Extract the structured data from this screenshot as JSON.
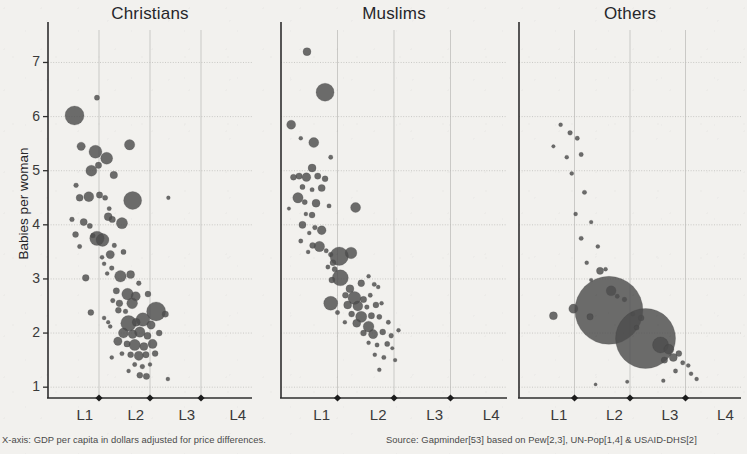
{
  "figure": {
    "y_axis_title": "Babies per woman",
    "footnote_left": "X-axis: GDP per capita in dollars adjusted for price differences.",
    "footnote_right": "Source: Gapminder[53] based on Pew[2,3], UN-Pop[1,4] & USAID-DHS[2]",
    "bubble_color": "#4d4d4d",
    "grid_color": "#b9b8b4",
    "axis_color": "#2e2e2e",
    "background_color": "#f2f1ee"
  },
  "chart_data": {
    "type": "scatter",
    "xlabel": "X-axis: GDP per capita in dollars adjusted for price differences.",
    "ylabel": "Babies per woman",
    "ylim": [
      0.8,
      7.6
    ],
    "yticks": [
      1,
      2,
      3,
      4,
      5,
      6,
      7
    ],
    "xticks": [
      "L1",
      "L2",
      "L3",
      "L4"
    ],
    "xlim": [
      0,
      4
    ],
    "grid": true,
    "legend": "none",
    "size_encoding": "population",
    "panels": [
      {
        "name": "Christians",
        "points": [
          {
            "x": 0.52,
            "y": 6.02,
            "r": 9.5
          },
          {
            "x": 0.96,
            "y": 6.35,
            "r": 2.6
          },
          {
            "x": 0.65,
            "y": 5.45,
            "r": 4.2
          },
          {
            "x": 0.93,
            "y": 5.35,
            "r": 6.5
          },
          {
            "x": 0.99,
            "y": 5.1,
            "r": 3.2
          },
          {
            "x": 1.15,
            "y": 5.23,
            "r": 6.0
          },
          {
            "x": 1.6,
            "y": 5.48,
            "r": 5.2
          },
          {
            "x": 0.85,
            "y": 5.0,
            "r": 5.5
          },
          {
            "x": 1.29,
            "y": 4.92,
            "r": 3.8
          },
          {
            "x": 0.55,
            "y": 4.73,
            "r": 2.4
          },
          {
            "x": 0.62,
            "y": 4.5,
            "r": 3.5
          },
          {
            "x": 0.8,
            "y": 4.52,
            "r": 5.0
          },
          {
            "x": 1.01,
            "y": 4.55,
            "r": 3.2
          },
          {
            "x": 1.12,
            "y": 4.5,
            "r": 2.6
          },
          {
            "x": 1.66,
            "y": 4.45,
            "r": 9.0
          },
          {
            "x": 2.36,
            "y": 4.5,
            "r": 1.9
          },
          {
            "x": 1.2,
            "y": 4.3,
            "r": 2.2
          },
          {
            "x": 1.18,
            "y": 4.15,
            "r": 4.0
          },
          {
            "x": 1.26,
            "y": 4.1,
            "r": 3.2
          },
          {
            "x": 0.47,
            "y": 4.1,
            "r": 2.4
          },
          {
            "x": 0.7,
            "y": 4.05,
            "r": 3.6
          },
          {
            "x": 0.82,
            "y": 3.98,
            "r": 2.6
          },
          {
            "x": 1.45,
            "y": 4.03,
            "r": 5.6
          },
          {
            "x": 0.54,
            "y": 3.82,
            "r": 3.0
          },
          {
            "x": 0.88,
            "y": 3.8,
            "r": 2.4
          },
          {
            "x": 0.96,
            "y": 3.75,
            "r": 7.2
          },
          {
            "x": 1.07,
            "y": 3.72,
            "r": 6.4
          },
          {
            "x": 0.62,
            "y": 3.6,
            "r": 2.2
          },
          {
            "x": 1.3,
            "y": 3.62,
            "r": 2.3
          },
          {
            "x": 1.22,
            "y": 3.45,
            "r": 4.2
          },
          {
            "x": 1.06,
            "y": 3.4,
            "r": 2.1
          },
          {
            "x": 1.48,
            "y": 3.5,
            "r": 2.6
          },
          {
            "x": 1.1,
            "y": 3.28,
            "r": 2.0
          },
          {
            "x": 1.25,
            "y": 3.2,
            "r": 2.4
          },
          {
            "x": 1.16,
            "y": 3.1,
            "r": 2.0
          },
          {
            "x": 1.42,
            "y": 3.05,
            "r": 5.8
          },
          {
            "x": 1.62,
            "y": 3.08,
            "r": 4.0
          },
          {
            "x": 0.74,
            "y": 3.02,
            "r": 3.4
          },
          {
            "x": 1.78,
            "y": 2.92,
            "r": 2.4
          },
          {
            "x": 1.34,
            "y": 2.78,
            "r": 3.2
          },
          {
            "x": 1.56,
            "y": 2.72,
            "r": 5.8
          },
          {
            "x": 1.72,
            "y": 2.68,
            "r": 4.6
          },
          {
            "x": 1.96,
            "y": 2.72,
            "r": 3.0
          },
          {
            "x": 1.27,
            "y": 2.6,
            "r": 2.3
          },
          {
            "x": 1.4,
            "y": 2.55,
            "r": 3.4
          },
          {
            "x": 1.65,
            "y": 2.55,
            "r": 5.4
          },
          {
            "x": 1.38,
            "y": 2.42,
            "r": 3.0
          },
          {
            "x": 1.52,
            "y": 2.4,
            "r": 2.4
          },
          {
            "x": 0.84,
            "y": 2.38,
            "r": 3.0
          },
          {
            "x": 2.12,
            "y": 2.4,
            "r": 9.5
          },
          {
            "x": 2.3,
            "y": 2.35,
            "r": 3.2
          },
          {
            "x": 1.1,
            "y": 2.28,
            "r": 2.0
          },
          {
            "x": 1.18,
            "y": 2.2,
            "r": 1.9
          },
          {
            "x": 1.22,
            "y": 2.12,
            "r": 2.0
          },
          {
            "x": 1.58,
            "y": 2.18,
            "r": 7.8
          },
          {
            "x": 1.73,
            "y": 2.2,
            "r": 4.0
          },
          {
            "x": 1.86,
            "y": 2.25,
            "r": 6.8
          },
          {
            "x": 2.02,
            "y": 2.15,
            "r": 4.2
          },
          {
            "x": 1.48,
            "y": 2.0,
            "r": 5.0
          },
          {
            "x": 1.66,
            "y": 1.98,
            "r": 4.4
          },
          {
            "x": 1.8,
            "y": 2.02,
            "r": 5.2
          },
          {
            "x": 1.95,
            "y": 1.95,
            "r": 3.6
          },
          {
            "x": 2.18,
            "y": 2.0,
            "r": 3.0
          },
          {
            "x": 1.37,
            "y": 1.85,
            "r": 4.2
          },
          {
            "x": 1.55,
            "y": 1.8,
            "r": 3.2
          },
          {
            "x": 1.7,
            "y": 1.78,
            "r": 5.6
          },
          {
            "x": 1.88,
            "y": 1.75,
            "r": 4.0
          },
          {
            "x": 2.05,
            "y": 1.8,
            "r": 4.6
          },
          {
            "x": 1.45,
            "y": 1.62,
            "r": 2.2
          },
          {
            "x": 1.62,
            "y": 1.6,
            "r": 3.0
          },
          {
            "x": 1.78,
            "y": 1.58,
            "r": 4.6
          },
          {
            "x": 1.92,
            "y": 1.6,
            "r": 3.2
          },
          {
            "x": 2.1,
            "y": 1.62,
            "r": 3.0
          },
          {
            "x": 1.25,
            "y": 1.55,
            "r": 2.0
          },
          {
            "x": 1.7,
            "y": 1.42,
            "r": 2.2
          },
          {
            "x": 1.85,
            "y": 1.38,
            "r": 2.4
          },
          {
            "x": 2.0,
            "y": 1.42,
            "r": 2.0
          },
          {
            "x": 1.58,
            "y": 1.3,
            "r": 2.0
          },
          {
            "x": 1.8,
            "y": 1.22,
            "r": 3.0
          },
          {
            "x": 1.93,
            "y": 1.2,
            "r": 3.2
          },
          {
            "x": 2.35,
            "y": 1.15,
            "r": 2.0
          }
        ]
      },
      {
        "name": "Muslims",
        "points": [
          {
            "x": 0.46,
            "y": 7.2,
            "r": 4.0
          },
          {
            "x": 0.78,
            "y": 6.45,
            "r": 9.0
          },
          {
            "x": 0.18,
            "y": 5.85,
            "r": 4.5
          },
          {
            "x": 0.58,
            "y": 5.52,
            "r": 5.0
          },
          {
            "x": 0.35,
            "y": 5.6,
            "r": 2.0
          },
          {
            "x": 0.88,
            "y": 5.25,
            "r": 2.2
          },
          {
            "x": 0.55,
            "y": 5.05,
            "r": 4.0
          },
          {
            "x": 0.32,
            "y": 4.9,
            "r": 3.2
          },
          {
            "x": 0.45,
            "y": 4.88,
            "r": 4.4
          },
          {
            "x": 0.65,
            "y": 4.9,
            "r": 3.2
          },
          {
            "x": 0.22,
            "y": 4.88,
            "r": 3.0
          },
          {
            "x": 0.78,
            "y": 4.85,
            "r": 3.0
          },
          {
            "x": 0.38,
            "y": 4.7,
            "r": 2.6
          },
          {
            "x": 0.55,
            "y": 4.65,
            "r": 2.2
          },
          {
            "x": 0.72,
            "y": 4.68,
            "r": 3.6
          },
          {
            "x": 0.3,
            "y": 4.5,
            "r": 5.2
          },
          {
            "x": 0.42,
            "y": 4.42,
            "r": 2.6
          },
          {
            "x": 0.62,
            "y": 4.4,
            "r": 4.0
          },
          {
            "x": 0.85,
            "y": 4.35,
            "r": 2.2
          },
          {
            "x": 0.14,
            "y": 4.3,
            "r": 1.8
          },
          {
            "x": 0.44,
            "y": 4.2,
            "r": 2.0
          },
          {
            "x": 0.55,
            "y": 4.18,
            "r": 3.0
          },
          {
            "x": 1.32,
            "y": 4.32,
            "r": 5.0
          },
          {
            "x": 0.38,
            "y": 4.0,
            "r": 3.6
          },
          {
            "x": 0.6,
            "y": 3.95,
            "r": 2.4
          },
          {
            "x": 0.5,
            "y": 3.85,
            "r": 2.0
          },
          {
            "x": 0.72,
            "y": 3.9,
            "r": 4.4
          },
          {
            "x": 0.35,
            "y": 3.7,
            "r": 2.2
          },
          {
            "x": 0.56,
            "y": 3.62,
            "r": 3.0
          },
          {
            "x": 0.68,
            "y": 3.6,
            "r": 5.2
          },
          {
            "x": 0.48,
            "y": 3.5,
            "r": 2.0
          },
          {
            "x": 0.8,
            "y": 3.52,
            "r": 2.2
          },
          {
            "x": 0.88,
            "y": 3.45,
            "r": 2.4
          },
          {
            "x": 1.03,
            "y": 3.42,
            "r": 9.2
          },
          {
            "x": 1.24,
            "y": 3.48,
            "r": 5.8
          },
          {
            "x": 0.92,
            "y": 3.3,
            "r": 3.0
          },
          {
            "x": 0.83,
            "y": 3.22,
            "r": 2.2
          },
          {
            "x": 0.95,
            "y": 3.18,
            "r": 2.6
          },
          {
            "x": 1.05,
            "y": 3.02,
            "r": 8.0
          },
          {
            "x": 0.9,
            "y": 2.98,
            "r": 3.0
          },
          {
            "x": 1.55,
            "y": 3.05,
            "r": 2.0
          },
          {
            "x": 1.42,
            "y": 2.92,
            "r": 3.4
          },
          {
            "x": 1.65,
            "y": 2.9,
            "r": 2.2
          },
          {
            "x": 1.22,
            "y": 2.82,
            "r": 4.0
          },
          {
            "x": 1.72,
            "y": 2.85,
            "r": 2.0
          },
          {
            "x": 1.14,
            "y": 2.7,
            "r": 3.0
          },
          {
            "x": 1.3,
            "y": 2.65,
            "r": 6.5
          },
          {
            "x": 1.46,
            "y": 2.62,
            "r": 3.2
          },
          {
            "x": 1.58,
            "y": 2.7,
            "r": 2.2
          },
          {
            "x": 0.88,
            "y": 2.55,
            "r": 7.0
          },
          {
            "x": 1.18,
            "y": 2.52,
            "r": 4.0
          },
          {
            "x": 1.36,
            "y": 2.5,
            "r": 5.0
          },
          {
            "x": 1.52,
            "y": 2.48,
            "r": 2.4
          },
          {
            "x": 1.68,
            "y": 2.52,
            "r": 3.0
          },
          {
            "x": 1.78,
            "y": 2.55,
            "r": 2.0
          },
          {
            "x": 1.0,
            "y": 2.38,
            "r": 2.2
          },
          {
            "x": 1.25,
            "y": 2.35,
            "r": 3.0
          },
          {
            "x": 1.42,
            "y": 2.3,
            "r": 5.6
          },
          {
            "x": 1.6,
            "y": 2.32,
            "r": 3.2
          },
          {
            "x": 1.74,
            "y": 2.3,
            "r": 2.6
          },
          {
            "x": 1.13,
            "y": 2.2,
            "r": 2.0
          },
          {
            "x": 1.34,
            "y": 2.18,
            "r": 4.0
          },
          {
            "x": 1.55,
            "y": 2.12,
            "r": 5.4
          },
          {
            "x": 1.9,
            "y": 2.2,
            "r": 2.2
          },
          {
            "x": 1.46,
            "y": 2.0,
            "r": 3.0
          },
          {
            "x": 1.63,
            "y": 1.98,
            "r": 4.6
          },
          {
            "x": 1.8,
            "y": 2.02,
            "r": 3.0
          },
          {
            "x": 1.95,
            "y": 1.95,
            "r": 2.4
          },
          {
            "x": 2.08,
            "y": 2.05,
            "r": 2.0
          },
          {
            "x": 1.55,
            "y": 1.82,
            "r": 2.0
          },
          {
            "x": 1.7,
            "y": 1.78,
            "r": 2.2
          },
          {
            "x": 1.88,
            "y": 1.8,
            "r": 2.6
          },
          {
            "x": 1.97,
            "y": 1.72,
            "r": 1.8
          },
          {
            "x": 1.66,
            "y": 1.6,
            "r": 2.0
          },
          {
            "x": 1.82,
            "y": 1.55,
            "r": 2.2
          },
          {
            "x": 2.02,
            "y": 1.5,
            "r": 1.9
          },
          {
            "x": 1.74,
            "y": 1.32,
            "r": 2.0
          }
        ]
      },
      {
        "name": "Others",
        "points": [
          {
            "x": 0.75,
            "y": 5.85,
            "r": 2.0
          },
          {
            "x": 0.92,
            "y": 5.7,
            "r": 2.4
          },
          {
            "x": 1.05,
            "y": 5.6,
            "r": 2.2
          },
          {
            "x": 0.62,
            "y": 5.45,
            "r": 1.8
          },
          {
            "x": 0.86,
            "y": 5.25,
            "r": 2.0
          },
          {
            "x": 1.12,
            "y": 5.3,
            "r": 2.2
          },
          {
            "x": 0.95,
            "y": 4.95,
            "r": 2.0
          },
          {
            "x": 1.18,
            "y": 4.6,
            "r": 2.2
          },
          {
            "x": 1.02,
            "y": 4.2,
            "r": 2.0
          },
          {
            "x": 1.3,
            "y": 4.05,
            "r": 1.9
          },
          {
            "x": 1.12,
            "y": 3.75,
            "r": 2.2
          },
          {
            "x": 1.42,
            "y": 3.6,
            "r": 2.0
          },
          {
            "x": 1.22,
            "y": 3.3,
            "r": 2.0
          },
          {
            "x": 1.46,
            "y": 3.15,
            "r": 3.6
          },
          {
            "x": 1.56,
            "y": 3.18,
            "r": 2.0
          },
          {
            "x": 1.3,
            "y": 2.98,
            "r": 1.8
          },
          {
            "x": 1.66,
            "y": 2.78,
            "r": 5.0
          },
          {
            "x": 1.77,
            "y": 2.68,
            "r": 2.2
          },
          {
            "x": 1.9,
            "y": 2.62,
            "r": 2.4
          },
          {
            "x": 0.62,
            "y": 2.32,
            "r": 4.0
          },
          {
            "x": 0.98,
            "y": 2.45,
            "r": 4.6
          },
          {
            "x": 1.62,
            "y": 2.42,
            "r": 34.0
          },
          {
            "x": 1.28,
            "y": 2.3,
            "r": 3.2
          },
          {
            "x": 2.05,
            "y": 2.35,
            "r": 2.2
          },
          {
            "x": 2.2,
            "y": 2.28,
            "r": 3.0
          },
          {
            "x": 2.28,
            "y": 1.9,
            "r": 30.0
          },
          {
            "x": 2.12,
            "y": 2.1,
            "r": 2.4
          },
          {
            "x": 2.55,
            "y": 1.78,
            "r": 8.0
          },
          {
            "x": 2.7,
            "y": 1.7,
            "r": 5.0
          },
          {
            "x": 2.78,
            "y": 1.55,
            "r": 4.0
          },
          {
            "x": 2.88,
            "y": 1.62,
            "r": 3.0
          },
          {
            "x": 2.62,
            "y": 1.5,
            "r": 3.2
          },
          {
            "x": 2.95,
            "y": 1.45,
            "r": 2.2
          },
          {
            "x": 3.05,
            "y": 1.4,
            "r": 2.0
          },
          {
            "x": 2.82,
            "y": 1.3,
            "r": 2.2
          },
          {
            "x": 3.1,
            "y": 1.25,
            "r": 2.0
          },
          {
            "x": 2.6,
            "y": 1.12,
            "r": 1.9
          },
          {
            "x": 3.2,
            "y": 1.15,
            "r": 2.0
          },
          {
            "x": 1.95,
            "y": 1.1,
            "r": 1.8
          },
          {
            "x": 1.38,
            "y": 1.05,
            "r": 1.6
          }
        ]
      }
    ]
  }
}
